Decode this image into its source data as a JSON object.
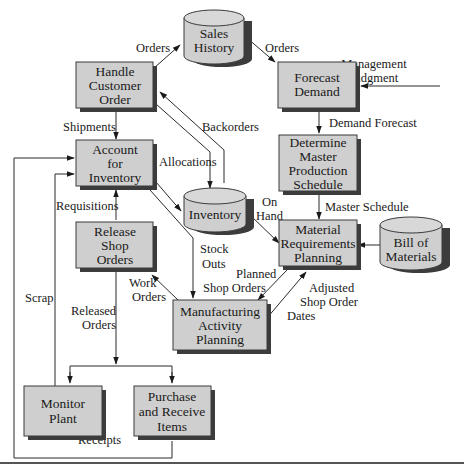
{
  "diagram": {
    "nodes": {
      "handle_customer_order": {
        "lines": [
          "Handle",
          "Customer",
          "Order"
        ],
        "shape": "process"
      },
      "sales_history": {
        "lines": [
          "Sales",
          "History"
        ],
        "shape": "datastore"
      },
      "forecast_demand": {
        "lines": [
          "Forecast",
          "Demand"
        ],
        "shape": "process"
      },
      "account_for_inventory": {
        "lines": [
          "Account",
          "for",
          "Inventory"
        ],
        "shape": "process"
      },
      "inventory": {
        "lines": [
          "Inventory"
        ],
        "shape": "datastore"
      },
      "determine_mps": {
        "lines": [
          "Determine",
          "Master",
          "Production",
          "Schedule"
        ],
        "shape": "process"
      },
      "release_shop_orders": {
        "lines": [
          "Release",
          "Shop",
          "Orders"
        ],
        "shape": "process"
      },
      "mrp": {
        "lines": [
          "Material",
          "Requirements",
          "Planning"
        ],
        "shape": "process"
      },
      "bill_of_materials": {
        "lines": [
          "Bill of",
          "Materials"
        ],
        "shape": "datastore"
      },
      "manufacturing_activity_planning": {
        "lines": [
          "Manufacturing",
          "Activity",
          "Planning"
        ],
        "shape": "process"
      },
      "monitor_plant": {
        "lines": [
          "Monitor",
          "Plant"
        ],
        "shape": "process"
      },
      "purchase_receive_items": {
        "lines": [
          "Purchase",
          "and Receive",
          "Items"
        ],
        "shape": "process"
      }
    },
    "edges": {
      "orders_to_sales": "Orders",
      "orders_to_forecast": "Orders",
      "management_judgment": [
        "Management",
        "Judgment"
      ],
      "demand_forecast": "Demand Forecast",
      "shipments": "Shipments",
      "backorders": "Backorders",
      "allocations": "Allocations",
      "master_schedule": "Master Schedule",
      "on_hand": [
        "On",
        "Hand"
      ],
      "requisitions": "Requisitions",
      "stock_outs": [
        "Stock",
        "Outs"
      ],
      "work_orders": [
        "Work",
        "Orders"
      ],
      "planned_shop_orders": [
        "Planned",
        "Shop Orders"
      ],
      "adjusted_shop_order_dates": [
        "Adjusted",
        "Shop Order",
        "Dates"
      ],
      "scrap": "Scrap",
      "released_orders": [
        "Released",
        "Orders"
      ],
      "receipts": "Receipts"
    }
  }
}
